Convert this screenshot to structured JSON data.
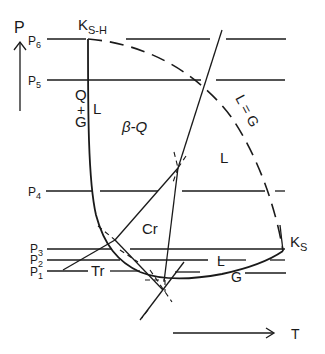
{
  "axes": {
    "y_label": "P",
    "x_label": "T",
    "pressure_levels": [
      "P1",
      "P2",
      "P3",
      "P4",
      "P5",
      "P6"
    ]
  },
  "points": {
    "upper_critical": {
      "main": "K",
      "sub": "S-H"
    },
    "lower_critical": {
      "main": "K",
      "sub": "S"
    }
  },
  "regions": {
    "q_plus_g_q": "Q",
    "q_plus_g_plus": "+",
    "q_plus_g_g": "G",
    "l_left": "L",
    "beta_q": "β-Q",
    "l_right": "L",
    "l_eq_g": "L = G",
    "cr": "Cr",
    "tr": "Tr",
    "l_bottom": "L",
    "g_bottom": "G"
  },
  "pressure_labels": [
    {
      "main": "P",
      "sub": "6"
    },
    {
      "main": "P",
      "sub": "5"
    },
    {
      "main": "P",
      "sub": "4"
    },
    {
      "main": "P",
      "sub": "3"
    },
    {
      "main": "P",
      "sub": "2"
    },
    {
      "main": "P",
      "sub": "1"
    }
  ]
}
